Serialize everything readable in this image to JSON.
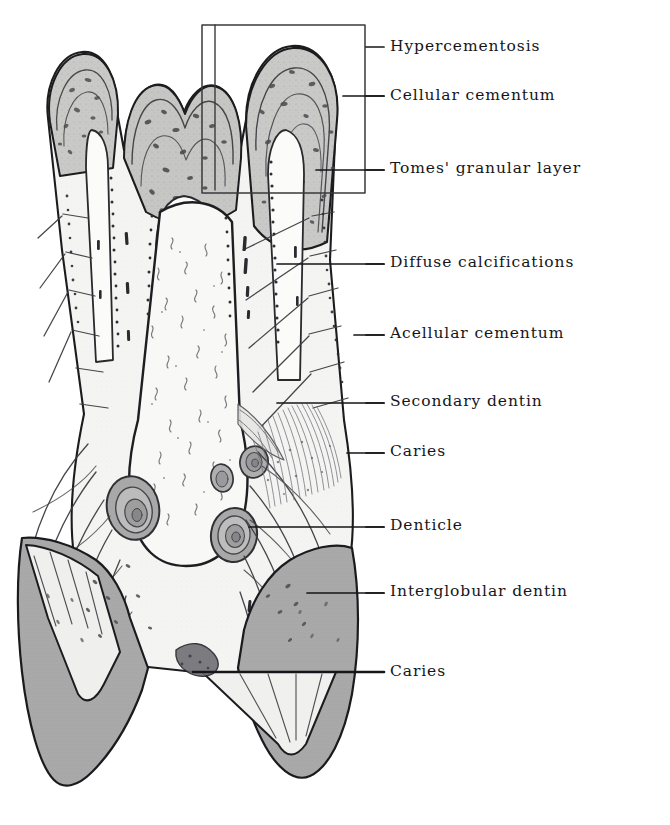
{
  "figure": {
    "kind": "histological-illustration",
    "background_color": "#ffffff",
    "ink_color": "#16161a",
    "enamel_fill": "#a9a9a9",
    "dentin_fill": "#f2f2f0",
    "cementum_fill": "#d8d8d6",
    "pulp_fill": "#fafaf8",
    "inset_box": {
      "name": "magnified-region-box",
      "x": 202,
      "y": 25,
      "width": 163,
      "height": 168,
      "stroke": "#3a3a3c"
    }
  },
  "labels": [
    {
      "id": "hypercementosis",
      "text": "Hypercementosis",
      "text_x": 390,
      "text_y": 48,
      "dash_x1": 366,
      "dash_x2": 384,
      "dash_y": 47,
      "leader": [
        [
          366,
          47
        ],
        [
          366,
          47
        ]
      ]
    },
    {
      "id": "cellular-cementum",
      "text": "Cellular cementum",
      "text_x": 390,
      "text_y": 97,
      "dash_x1": 366,
      "dash_x2": 384,
      "dash_y": 96,
      "leader": [
        [
          384,
          96
        ],
        [
          343,
          96
        ]
      ]
    },
    {
      "id": "tomes-granular-layer",
      "text": "Tomes' granular layer",
      "text_x": 390,
      "text_y": 170,
      "dash_x1": 366,
      "dash_x2": 384,
      "dash_y": 170,
      "leader": [
        [
          384,
          170
        ],
        [
          316,
          170
        ]
      ]
    },
    {
      "id": "diffuse-calcifications",
      "text": "Diffuse calcifications",
      "text_x": 390,
      "text_y": 264,
      "dash_x1": 366,
      "dash_x2": 384,
      "dash_y": 264,
      "leader": [
        [
          384,
          264
        ],
        [
          277,
          264
        ]
      ]
    },
    {
      "id": "acellular-cementum",
      "text": "Acellular cementum",
      "text_x": 390,
      "text_y": 335,
      "dash_x1": 366,
      "dash_x2": 384,
      "dash_y": 335,
      "leader": [
        [
          384,
          335
        ],
        [
          354,
          335
        ]
      ]
    },
    {
      "id": "secondary-dentin",
      "text": "Secondary dentin",
      "text_x": 390,
      "text_y": 403,
      "dash_x1": 366,
      "dash_x2": 384,
      "dash_y": 403,
      "leader": [
        [
          384,
          403
        ],
        [
          277,
          403
        ]
      ]
    },
    {
      "id": "caries-upper",
      "text": "Caries",
      "text_x": 390,
      "text_y": 453,
      "dash_x1": 366,
      "dash_x2": 384,
      "dash_y": 453,
      "leader": [
        [
          384,
          453
        ],
        [
          347,
          453
        ]
      ]
    },
    {
      "id": "denticle",
      "text": "Denticle",
      "text_x": 390,
      "text_y": 527,
      "dash_x1": 366,
      "dash_x2": 384,
      "dash_y": 527,
      "leader": [
        [
          384,
          527
        ],
        [
          249,
          527
        ]
      ]
    },
    {
      "id": "interglobular-dentin",
      "text": "Interglobular dentin",
      "text_x": 390,
      "text_y": 593,
      "dash_x1": 366,
      "dash_x2": 384,
      "dash_y": 593,
      "leader": [
        [
          384,
          593
        ],
        [
          307,
          593
        ]
      ]
    },
    {
      "id": "caries-lower",
      "text": "Caries",
      "text_x": 390,
      "text_y": 673,
      "dash_x1": 366,
      "dash_x2": 384,
      "dash_y": 672,
      "leader": [
        [
          384,
          672
        ],
        [
          193,
          672
        ]
      ]
    }
  ]
}
